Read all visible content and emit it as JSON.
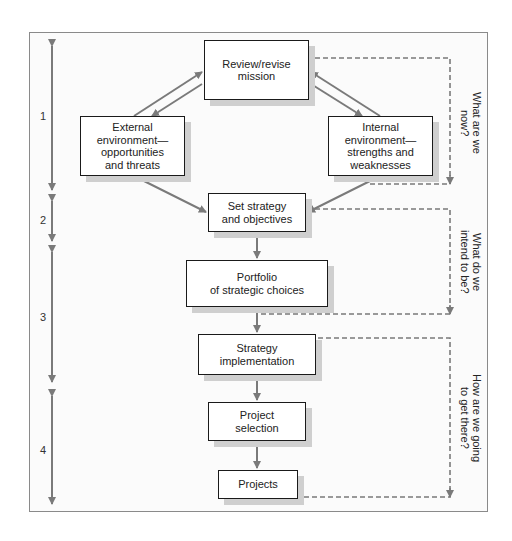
{
  "diagram": {
    "boxes": [
      {
        "id": "review-mission",
        "label": "Review/revise\nmission"
      },
      {
        "id": "external-environment",
        "label": "External\nenvironment—\nopportunities\nand threats"
      },
      {
        "id": "internal-environment",
        "label": "Internal\nenvironment—\nstrengths and\nweaknesses"
      },
      {
        "id": "set-strategy",
        "label": "Set strategy\nand objectives"
      },
      {
        "id": "portfolio",
        "label": "Portfolio\nof strategic choices"
      },
      {
        "id": "strategy-implementation",
        "label": "Strategy\nimplementation"
      },
      {
        "id": "project-selection",
        "label": "Project\nselection"
      },
      {
        "id": "projects",
        "label": "Projects"
      }
    ],
    "stages": [
      {
        "number": "1"
      },
      {
        "number": "2"
      },
      {
        "number": "3"
      },
      {
        "number": "4"
      }
    ],
    "questions": [
      {
        "text": "What are we now?"
      },
      {
        "text": "What do we\nintend to be?"
      },
      {
        "text": "How are we going\nto get there?"
      }
    ],
    "colors": {
      "arrow": "#7a7a7a",
      "box_border": "#1a1a1a",
      "shadow": "#cfcfcf",
      "frame_border": "#8a8a8a"
    }
  }
}
